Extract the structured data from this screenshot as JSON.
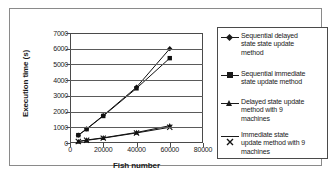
{
  "chart_data": {
    "type": "line",
    "title": "",
    "xlabel": "Fish number",
    "ylabel": "Execution time (s)",
    "xlim": [
      0,
      80000
    ],
    "ylim": [
      0,
      7000
    ],
    "xticks": [
      "0",
      "20000",
      "40000",
      "60000",
      "80000"
    ],
    "yticks": [
      "0",
      "1000",
      "2000",
      "3000",
      "4000",
      "5000",
      "6000",
      "7000"
    ],
    "grid": "horizontal",
    "legend_position": "right",
    "x": [
      5000,
      10000,
      20000,
      40000,
      60000
    ],
    "series": [
      {
        "name": "Sequential delayed state state update method",
        "marker": "diamond",
        "values": [
          500,
          900,
          1750,
          3550,
          6000
        ]
      },
      {
        "name": "Sequential immediate state update method",
        "marker": "square",
        "values": [
          500,
          880,
          1720,
          3480,
          5400
        ]
      },
      {
        "name": "Delayed state update method with 9 machines",
        "marker": "triangle",
        "values": [
          100,
          190,
          330,
          670,
          1100
        ]
      },
      {
        "name": "Immediate state update method with 9 machines",
        "marker": "cross",
        "values": [
          90,
          170,
          310,
          640,
          1000
        ]
      }
    ]
  },
  "legend": {
    "items": [
      {
        "label": "Sequential delayed\nstate state update\nmethod",
        "marker": "diamond-marker"
      },
      {
        "label": "Sequential immediate\nstate update method",
        "marker": "square-marker"
      },
      {
        "label": "Delayed state update\nmethod with 9\nmachines",
        "marker": "triangle-marker"
      },
      {
        "label": "Immediate state\nupdate method with 9\nmachines",
        "marker": "cross-marker"
      }
    ]
  }
}
